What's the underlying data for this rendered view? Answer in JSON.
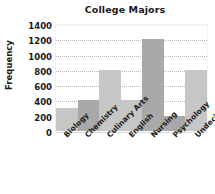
{
  "chart_data": {
    "type": "bar",
    "title": "College Majors",
    "xlabel": "",
    "ylabel": "Frequency",
    "categories": [
      "Biology",
      "Chemistry",
      "Culinary Arts",
      "English",
      "Nursing",
      "Psychology",
      "Undecided"
    ],
    "values": [
      300,
      400,
      800,
      400,
      1200,
      200,
      800
    ],
    "ylim": [
      0,
      1400
    ],
    "ytick_labels": [
      "0",
      "200",
      "400",
      "600",
      "800",
      "1000",
      "1200",
      "1400"
    ],
    "ytick_values": [
      0,
      200,
      400,
      600,
      800,
      1000,
      1200,
      1400
    ],
    "grid": true,
    "grid_style": "dotted",
    "legend": "none",
    "bar_colors": [
      "#c6c6c6",
      "#a9a9a9",
      "#c6c6c6",
      "#c6c6c6",
      "#a9a9a9",
      "#a9a9a9",
      "#c6c6c6"
    ],
    "colors": {
      "bar_light": "#c6c6c6",
      "bar_dark": "#a9a9a9",
      "grid": "#b9b9b9",
      "text": "#1a1a1a",
      "background": "#ffffff"
    }
  }
}
